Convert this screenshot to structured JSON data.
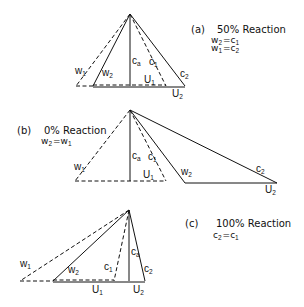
{
  "diagrams": [
    {
      "id": "a",
      "caption_letter": "(a)",
      "caption_title": "50% Reaction",
      "equations": [
        {
          "lhs": "w",
          "lhs_sub": "2",
          "op": "=",
          "rhs": "c",
          "rhs_sub": "1"
        },
        {
          "lhs": "w",
          "lhs_sub": "1",
          "op": "=",
          "rhs": "c",
          "rhs_sub": "2"
        }
      ],
      "labels": {
        "w1": {
          "main": "w",
          "sub": "1"
        },
        "w2": {
          "main": "w",
          "sub": "2"
        },
        "ca": {
          "main": "c",
          "sub": "a"
        },
        "c1": {
          "main": "c",
          "sub": "1"
        },
        "c2": {
          "main": "c",
          "sub": "2"
        },
        "U1": {
          "main": "U",
          "sub": "1"
        },
        "U2": {
          "main": "U",
          "sub": "2"
        }
      }
    },
    {
      "id": "b",
      "caption_letter": "(b)",
      "caption_title": "0% Reaction",
      "equations": [
        {
          "lhs": "w",
          "lhs_sub": "2",
          "op": "=",
          "rhs": "w",
          "rhs_sub": "1"
        }
      ],
      "labels": {
        "w1": {
          "main": "w",
          "sub": "1"
        },
        "w2": {
          "main": "w",
          "sub": "2"
        },
        "ca": {
          "main": "c",
          "sub": "a"
        },
        "c1": {
          "main": "c",
          "sub": "1"
        },
        "c2": {
          "main": "c",
          "sub": "2"
        },
        "U1": {
          "main": "U",
          "sub": "1"
        },
        "U2": {
          "main": "U",
          "sub": "2"
        }
      }
    },
    {
      "id": "c",
      "caption_letter": "(c)",
      "caption_title": "100% Reaction",
      "equations": [
        {
          "lhs": "c",
          "lhs_sub": "2",
          "op": "=",
          "rhs": "c",
          "rhs_sub": "1"
        }
      ],
      "labels": {
        "w1": {
          "main": "w",
          "sub": "1"
        },
        "w2": {
          "main": "w",
          "sub": "2"
        },
        "ca": {
          "main": "c",
          "sub": "a"
        },
        "c1": {
          "main": "c",
          "sub": "1"
        },
        "c2": {
          "main": "c",
          "sub": "2"
        },
        "U1": {
          "main": "U",
          "sub": "1"
        },
        "U2": {
          "main": "U",
          "sub": "2"
        }
      }
    }
  ],
  "colors": {
    "line": "#111111",
    "background": "#ffffff"
  }
}
